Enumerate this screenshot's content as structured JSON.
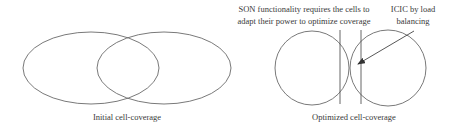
{
  "left_panel": {
    "caption": "Initial cell-coverage"
  },
  "right_panel": {
    "caption": "Optimized cell-coverage",
    "annotation_son_line1": "SON functionality requires the cells to",
    "annotation_son_line2": "adapt their power to optimize coverage",
    "annotation_icic_line1": "ICIC by load",
    "annotation_icic_line2": "balancing"
  },
  "colors": {
    "stroke": "#6a6a6a",
    "text": "#3a3a3a"
  }
}
